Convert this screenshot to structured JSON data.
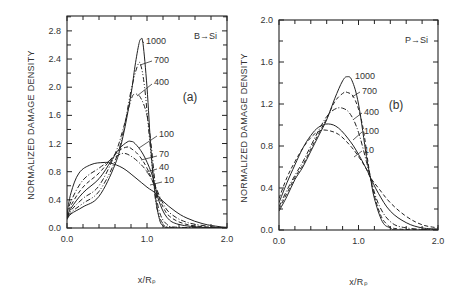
{
  "chart_data": [
    {
      "type": "line",
      "panel": "(a)",
      "title": "B→Si",
      "xlabel": "x/Rp",
      "ylabel": "NORMALIZED DAMAGE DENSITY",
      "xlim": [
        0.0,
        2.0
      ],
      "ylim": [
        0.0,
        3.0
      ],
      "xticks": [
        "0.0",
        "1.0",
        "2.0"
      ],
      "yticks": [
        "0.0",
        "0.4",
        "0.8",
        "1.2",
        "1.6",
        "2.0",
        "2.4",
        "2.8"
      ],
      "grid": false,
      "legend": "inline labels",
      "series": [
        {
          "name": "1000",
          "dash": "solid",
          "x": [
            0.0,
            0.05,
            0.2,
            0.4,
            0.6,
            0.7,
            0.8,
            0.85,
            0.9,
            0.925,
            0.95,
            1.0,
            1.05,
            1.1,
            1.15,
            1.2,
            1.3,
            1.5,
            2.0
          ],
          "y": [
            0.12,
            0.2,
            0.3,
            0.45,
            0.9,
            1.3,
            1.9,
            2.3,
            2.62,
            2.68,
            2.62,
            2.0,
            1.1,
            0.5,
            0.15,
            0.03,
            0.0,
            0.0,
            0.0
          ]
        },
        {
          "name": "700",
          "dash": "dashdot2",
          "x": [
            0.0,
            0.05,
            0.2,
            0.4,
            0.6,
            0.7,
            0.8,
            0.88,
            0.92,
            0.97,
            1.02,
            1.08,
            1.12,
            1.2,
            1.3,
            1.5,
            2.0
          ],
          "y": [
            0.13,
            0.22,
            0.35,
            0.52,
            0.95,
            1.35,
            1.95,
            2.3,
            2.32,
            2.0,
            1.4,
            0.7,
            0.3,
            0.06,
            0.01,
            0.0,
            0.0
          ]
        },
        {
          "name": "400",
          "dash": "dashdot",
          "x": [
            0.0,
            0.05,
            0.2,
            0.4,
            0.6,
            0.7,
            0.8,
            0.85,
            0.92,
            1.0,
            1.05,
            1.1,
            1.15,
            1.25,
            1.4,
            2.0
          ],
          "y": [
            0.14,
            0.25,
            0.42,
            0.6,
            1.05,
            1.4,
            1.82,
            1.9,
            1.85,
            1.6,
            1.2,
            0.65,
            0.25,
            0.05,
            0.01,
            0.0
          ]
        },
        {
          "name": "100",
          "dash": "solid",
          "x": [
            0.0,
            0.05,
            0.2,
            0.4,
            0.55,
            0.65,
            0.75,
            0.8,
            0.85,
            0.95,
            1.05,
            1.1,
            1.15,
            1.25,
            1.4,
            1.7,
            2.0
          ],
          "y": [
            0.15,
            0.28,
            0.5,
            0.7,
            0.95,
            1.12,
            1.22,
            1.23,
            1.2,
            1.05,
            0.8,
            0.6,
            0.38,
            0.15,
            0.05,
            0.01,
            0.0
          ]
        },
        {
          "name": "70",
          "dash": "dashed",
          "x": [
            0.0,
            0.05,
            0.2,
            0.4,
            0.55,
            0.65,
            0.75,
            0.8,
            0.9,
            1.0,
            1.1,
            1.2,
            1.3,
            1.5,
            1.8,
            2.0
          ],
          "y": [
            0.16,
            0.32,
            0.58,
            0.78,
            0.98,
            1.1,
            1.15,
            1.13,
            1.03,
            0.85,
            0.58,
            0.3,
            0.15,
            0.05,
            0.01,
            0.0
          ]
        },
        {
          "name": "40",
          "dash": "dashdot",
          "x": [
            0.0,
            0.05,
            0.2,
            0.4,
            0.55,
            0.65,
            0.72,
            0.8,
            0.9,
            1.0,
            1.1,
            1.2,
            1.3,
            1.5,
            1.8,
            2.0
          ],
          "y": [
            0.17,
            0.38,
            0.68,
            0.85,
            0.97,
            1.04,
            1.06,
            1.02,
            0.93,
            0.8,
            0.6,
            0.35,
            0.2,
            0.08,
            0.02,
            0.0
          ]
        },
        {
          "name": "10",
          "dash": "solid",
          "x": [
            0.0,
            0.05,
            0.15,
            0.3,
            0.45,
            0.55,
            0.7,
            0.85,
            1.0,
            1.1,
            1.2,
            1.35,
            1.5,
            1.7,
            1.9,
            2.0
          ],
          "y": [
            0.2,
            0.5,
            0.78,
            0.9,
            0.93,
            0.92,
            0.85,
            0.72,
            0.58,
            0.5,
            0.38,
            0.24,
            0.14,
            0.06,
            0.02,
            0.01
          ]
        }
      ],
      "annotations": [
        "1000",
        "700",
        "400",
        "100",
        "70",
        "40",
        "10",
        "B→Si",
        "(a)"
      ]
    },
    {
      "type": "line",
      "panel": "(b)",
      "title": "P→Si",
      "xlabel": "x/Rp",
      "ylabel": "NORMALIZED DAMAGE DENSITY",
      "xlim": [
        0.0,
        2.0
      ],
      "ylim": [
        0.0,
        2.0
      ],
      "xticks": [
        "0.0",
        "1.0",
        "2.0"
      ],
      "yticks": [
        "0.0",
        "0.4",
        "0.8",
        "1.2",
        "1.6",
        "2.0"
      ],
      "grid": false,
      "legend": "inline labels",
      "series": [
        {
          "name": "1000",
          "dash": "solid",
          "x": [
            0.0,
            0.1,
            0.2,
            0.3,
            0.4,
            0.5,
            0.6,
            0.7,
            0.8,
            0.86,
            0.92,
            1.0,
            1.1,
            1.15,
            1.2,
            1.3,
            1.4,
            1.5,
            2.0
          ],
          "y": [
            0.18,
            0.32,
            0.48,
            0.6,
            0.75,
            0.9,
            1.05,
            1.25,
            1.42,
            1.46,
            1.42,
            1.2,
            0.7,
            0.5,
            0.3,
            0.08,
            0.02,
            0.0,
            0.0
          ]
        },
        {
          "name": "700",
          "dash": "dashed",
          "x": [
            0.0,
            0.1,
            0.2,
            0.3,
            0.4,
            0.5,
            0.6,
            0.7,
            0.8,
            0.86,
            0.95,
            1.05,
            1.15,
            1.25,
            1.35,
            1.5,
            2.0
          ],
          "y": [
            0.2,
            0.35,
            0.5,
            0.62,
            0.77,
            0.92,
            1.06,
            1.22,
            1.3,
            1.31,
            1.25,
            1.0,
            0.5,
            0.2,
            0.06,
            0.01,
            0.0
          ]
        },
        {
          "name": "400",
          "dash": "dashdot",
          "x": [
            0.0,
            0.1,
            0.2,
            0.3,
            0.4,
            0.5,
            0.6,
            0.7,
            0.8,
            0.9,
            1.0,
            1.1,
            1.15,
            1.25,
            1.4,
            1.6,
            2.0
          ],
          "y": [
            0.22,
            0.38,
            0.52,
            0.65,
            0.8,
            0.95,
            1.08,
            1.15,
            1.16,
            1.1,
            0.93,
            0.65,
            0.5,
            0.25,
            0.08,
            0.02,
            0.0
          ]
        },
        {
          "name": "100",
          "dash": "solid",
          "x": [
            0.0,
            0.1,
            0.2,
            0.3,
            0.4,
            0.5,
            0.62,
            0.75,
            0.9,
            1.0,
            1.1,
            1.15,
            1.25,
            1.4,
            1.6,
            1.8,
            2.0
          ],
          "y": [
            0.26,
            0.45,
            0.62,
            0.78,
            0.9,
            0.98,
            1.01,
            0.97,
            0.84,
            0.72,
            0.58,
            0.5,
            0.35,
            0.18,
            0.07,
            0.02,
            0.01
          ]
        },
        {
          "name": "10",
          "dash": "dashed",
          "x": [
            0.0,
            0.1,
            0.2,
            0.3,
            0.4,
            0.5,
            0.6,
            0.75,
            0.9,
            1.0,
            1.1,
            1.15,
            1.25,
            1.4,
            1.6,
            1.8,
            2.0
          ],
          "y": [
            0.3,
            0.5,
            0.65,
            0.78,
            0.88,
            0.94,
            0.95,
            0.91,
            0.8,
            0.7,
            0.58,
            0.5,
            0.4,
            0.26,
            0.13,
            0.05,
            0.02
          ]
        }
      ],
      "annotations": [
        "1000",
        "700",
        "400",
        "100",
        "10",
        "P→Si",
        "(b)"
      ]
    }
  ],
  "panels": [
    {
      "id": "a",
      "frame": {
        "x0": 67,
        "y0": 16,
        "x1": 227,
        "y1": 228
      },
      "px_per_x": 80,
      "px_per_y": 70.4,
      "y_zero_px": 228,
      "tag": "(a)",
      "title": "B→Si",
      "xlabel": "x/Rₚ",
      "ylabel": "NORMALIZED DAMAGE DENSITY",
      "yticks": [
        {
          "v": 0.0,
          "label": "0.0"
        },
        {
          "v": 0.4,
          "label": "0.4"
        },
        {
          "v": 0.8,
          "label": "0.8"
        },
        {
          "v": 1.2,
          "label": "1.2"
        },
        {
          "v": 1.6,
          "label": "1.6"
        },
        {
          "v": 2.0,
          "label": "2.0"
        },
        {
          "v": 2.4,
          "label": "2.4"
        },
        {
          "v": 2.8,
          "label": "2.8"
        }
      ],
      "xticks": [
        {
          "v": 0.0,
          "label": "0.0"
        },
        {
          "v": 1.0,
          "label": "1.0"
        },
        {
          "v": 2.0,
          "label": "2.0"
        }
      ],
      "labels": [
        {
          "text": "1000",
          "x": 146,
          "y": 44,
          "lx1": 144,
          "ly1": 43,
          "lx2": 142,
          "ly2": 41
        },
        {
          "text": "700",
          "x": 154,
          "y": 63,
          "lx1": 152,
          "ly1": 61,
          "lx2": 140,
          "ly2": 65
        },
        {
          "text": "400",
          "x": 154,
          "y": 85,
          "lx1": 152,
          "ly1": 84,
          "lx2": 137,
          "ly2": 96
        },
        {
          "text": "100",
          "x": 159,
          "y": 137,
          "lx1": 157,
          "ly1": 136,
          "lx2": 139,
          "ly2": 148
        },
        {
          "text": "70",
          "x": 159,
          "y": 157,
          "lx1": 157,
          "ly1": 156,
          "lx2": 141,
          "ly2": 160
        },
        {
          "text": "40",
          "x": 159,
          "y": 170,
          "lx1": 157,
          "ly1": 169,
          "lx2": 146,
          "ly2": 172
        },
        {
          "text": "10",
          "x": 164,
          "y": 183,
          "lx1": 162,
          "ly1": 182,
          "lx2": 150,
          "ly2": 185
        }
      ]
    },
    {
      "id": "b",
      "frame": {
        "x0": 279,
        "y0": 20,
        "x1": 438,
        "y1": 230
      },
      "px_per_x": 79.5,
      "px_per_y": 105,
      "y_zero_px": 230,
      "tag": "(b)",
      "title": "P→Si",
      "xlabel": "x/Rₚ",
      "ylabel": "NORMALIZED DAMAGE DENSITY",
      "yticks": [
        {
          "v": 0.0,
          "label": "0.0"
        },
        {
          "v": 0.4,
          "label": "0.4"
        },
        {
          "v": 0.8,
          "label": "0.8"
        },
        {
          "v": 1.2,
          "label": "1.2"
        },
        {
          "v": 1.6,
          "label": "1.6"
        },
        {
          "v": 2.0,
          "label": "2.0"
        }
      ],
      "xticks": [
        {
          "v": 0.0,
          "label": "0.0"
        },
        {
          "v": 1.0,
          "label": "1.0"
        },
        {
          "v": 2.0,
          "label": "2.0"
        }
      ],
      "labels": [
        {
          "text": "1000",
          "x": 355,
          "y": 79,
          "lx1": 0,
          "ly1": 0,
          "lx2": 0,
          "ly2": 0
        },
        {
          "text": "700",
          "x": 362,
          "y": 94,
          "lx1": 360,
          "ly1": 92,
          "lx2": 352,
          "ly2": 97
        },
        {
          "text": "400",
          "x": 364,
          "y": 115,
          "lx1": 362,
          "ly1": 113,
          "lx2": 354,
          "ly2": 119
        },
        {
          "text": "100",
          "x": 364,
          "y": 134,
          "lx1": 362,
          "ly1": 132,
          "lx2": 353,
          "ly2": 140
        },
        {
          "text": "10",
          "x": 364,
          "y": 153,
          "lx1": 362,
          "ly1": 151,
          "lx2": 354,
          "ly2": 157
        }
      ]
    }
  ]
}
